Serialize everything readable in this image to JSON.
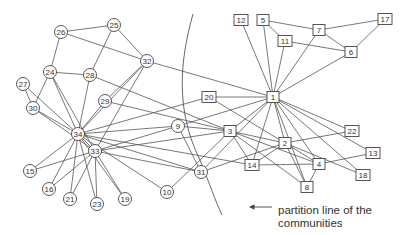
{
  "diagram": {
    "type": "network-graph",
    "annotation": {
      "line1": "partition line of the",
      "line2": "communities"
    },
    "nodes": [
      {
        "id": "26",
        "x": 61,
        "y": 32,
        "shape": "circle"
      },
      {
        "id": "25",
        "x": 114,
        "y": 25,
        "shape": "circle"
      },
      {
        "id": "32",
        "x": 147,
        "y": 61,
        "shape": "circle"
      },
      {
        "id": "24",
        "x": 50,
        "y": 72,
        "shape": "circle"
      },
      {
        "id": "28",
        "x": 90,
        "y": 75,
        "shape": "circle"
      },
      {
        "id": "27",
        "x": 23,
        "y": 84,
        "shape": "circle"
      },
      {
        "id": "30",
        "x": 33,
        "y": 108,
        "shape": "circle"
      },
      {
        "id": "29",
        "x": 105,
        "y": 101,
        "shape": "circle"
      },
      {
        "id": "34",
        "x": 78,
        "y": 134,
        "shape": "circle"
      },
      {
        "id": "33",
        "x": 95,
        "y": 151,
        "shape": "circle"
      },
      {
        "id": "9",
        "x": 178,
        "y": 126,
        "shape": "circle"
      },
      {
        "id": "15",
        "x": 30,
        "y": 171,
        "shape": "circle"
      },
      {
        "id": "16",
        "x": 49,
        "y": 189,
        "shape": "circle"
      },
      {
        "id": "21",
        "x": 70,
        "y": 199,
        "shape": "circle"
      },
      {
        "id": "23",
        "x": 97,
        "y": 204,
        "shape": "circle"
      },
      {
        "id": "19",
        "x": 125,
        "y": 199,
        "shape": "circle"
      },
      {
        "id": "10",
        "x": 167,
        "y": 192,
        "shape": "circle"
      },
      {
        "id": "31",
        "x": 201,
        "y": 172,
        "shape": "circle"
      },
      {
        "id": "12",
        "x": 241,
        "y": 20,
        "shape": "square"
      },
      {
        "id": "5",
        "x": 263,
        "y": 20,
        "shape": "square"
      },
      {
        "id": "7",
        "x": 319,
        "y": 30,
        "shape": "square"
      },
      {
        "id": "17",
        "x": 385,
        "y": 19,
        "shape": "square"
      },
      {
        "id": "11",
        "x": 285,
        "y": 41,
        "shape": "square"
      },
      {
        "id": "6",
        "x": 351,
        "y": 52,
        "shape": "square"
      },
      {
        "id": "20",
        "x": 209,
        "y": 97,
        "shape": "square"
      },
      {
        "id": "1",
        "x": 273,
        "y": 97,
        "shape": "square"
      },
      {
        "id": "3",
        "x": 230,
        "y": 131,
        "shape": "square"
      },
      {
        "id": "22",
        "x": 352,
        "y": 131,
        "shape": "square"
      },
      {
        "id": "2",
        "x": 285,
        "y": 143,
        "shape": "square"
      },
      {
        "id": "13",
        "x": 373,
        "y": 153,
        "shape": "square"
      },
      {
        "id": "14",
        "x": 252,
        "y": 165,
        "shape": "square"
      },
      {
        "id": "4",
        "x": 319,
        "y": 164,
        "shape": "square"
      },
      {
        "id": "18",
        "x": 363,
        "y": 175,
        "shape": "square"
      },
      {
        "id": "8",
        "x": 307,
        "y": 187,
        "shape": "square"
      }
    ],
    "edges": [
      [
        "26",
        "25"
      ],
      [
        "26",
        "24"
      ],
      [
        "26",
        "32"
      ],
      [
        "25",
        "32"
      ],
      [
        "25",
        "28"
      ],
      [
        "24",
        "28"
      ],
      [
        "24",
        "30"
      ],
      [
        "24",
        "34"
      ],
      [
        "24",
        "33"
      ],
      [
        "27",
        "30"
      ],
      [
        "27",
        "34"
      ],
      [
        "28",
        "34"
      ],
      [
        "28",
        "3"
      ],
      [
        "32",
        "34"
      ],
      [
        "32",
        "33"
      ],
      [
        "32",
        "29"
      ],
      [
        "32",
        "1"
      ],
      [
        "29",
        "34"
      ],
      [
        "29",
        "3"
      ],
      [
        "30",
        "34"
      ],
      [
        "30",
        "33"
      ],
      [
        "34",
        "33"
      ],
      [
        "34",
        "9"
      ],
      [
        "34",
        "10"
      ],
      [
        "34",
        "14"
      ],
      [
        "34",
        "20"
      ],
      [
        "34",
        "31"
      ],
      [
        "34",
        "15"
      ],
      [
        "34",
        "16"
      ],
      [
        "34",
        "19"
      ],
      [
        "34",
        "21"
      ],
      [
        "34",
        "23"
      ],
      [
        "33",
        "9"
      ],
      [
        "33",
        "3"
      ],
      [
        "33",
        "31"
      ],
      [
        "33",
        "15"
      ],
      [
        "33",
        "16"
      ],
      [
        "33",
        "19"
      ],
      [
        "33",
        "21"
      ],
      [
        "33",
        "23"
      ],
      [
        "9",
        "1"
      ],
      [
        "9",
        "3"
      ],
      [
        "9",
        "31"
      ],
      [
        "10",
        "3"
      ],
      [
        "31",
        "2"
      ],
      [
        "31",
        "1"
      ],
      [
        "12",
        "1"
      ],
      [
        "5",
        "1"
      ],
      [
        "5",
        "7"
      ],
      [
        "5",
        "11"
      ],
      [
        "11",
        "1"
      ],
      [
        "11",
        "6"
      ],
      [
        "7",
        "1"
      ],
      [
        "7",
        "6"
      ],
      [
        "7",
        "17"
      ],
      [
        "6",
        "17"
      ],
      [
        "6",
        "1"
      ],
      [
        "20",
        "1"
      ],
      [
        "20",
        "2"
      ],
      [
        "1",
        "3"
      ],
      [
        "1",
        "2"
      ],
      [
        "1",
        "4"
      ],
      [
        "1",
        "8"
      ],
      [
        "1",
        "14"
      ],
      [
        "1",
        "22"
      ],
      [
        "1",
        "13"
      ],
      [
        "1",
        "18"
      ],
      [
        "3",
        "2"
      ],
      [
        "3",
        "4"
      ],
      [
        "3",
        "8"
      ],
      [
        "3",
        "14"
      ],
      [
        "2",
        "4"
      ],
      [
        "2",
        "8"
      ],
      [
        "2",
        "14"
      ],
      [
        "2",
        "22"
      ],
      [
        "2",
        "18"
      ],
      [
        "4",
        "8"
      ],
      [
        "4",
        "13"
      ],
      [
        "14",
        "4"
      ]
    ],
    "partition_line_path": "M193,14 C180,60 175,110 200,160 C210,185 215,200 222,215",
    "arrow": {
      "x1": 272,
      "y1": 207,
      "x2": 250,
      "y2": 207
    }
  }
}
